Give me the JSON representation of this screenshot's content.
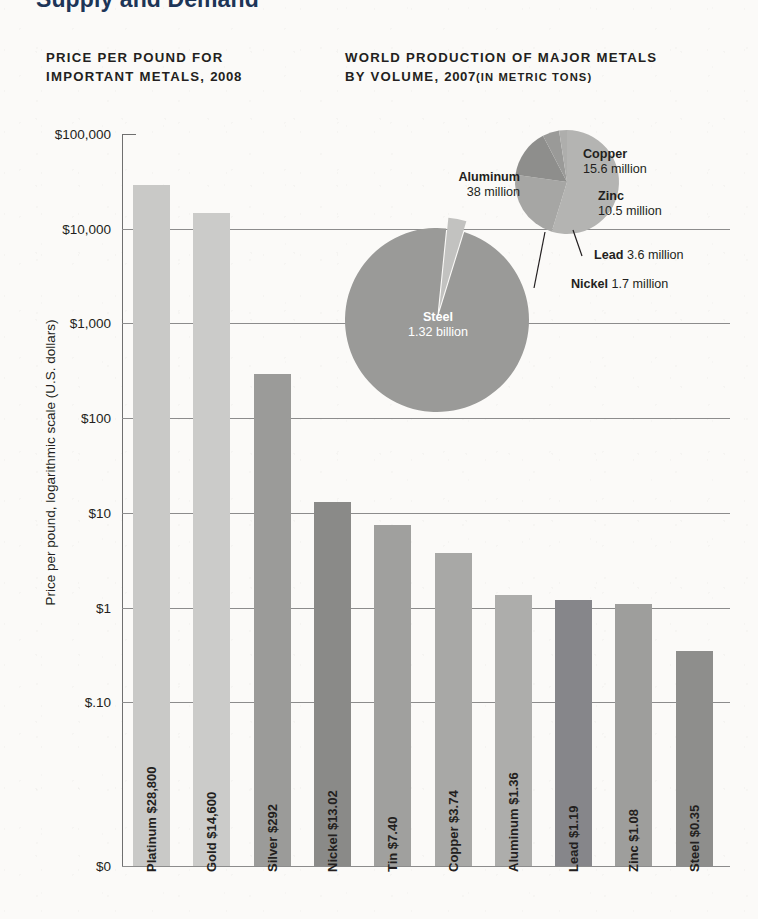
{
  "page": {
    "title": "Supply and Demand",
    "background_color": "#fbfaf8"
  },
  "headings": {
    "left_line1": "PRICE PER POUND FOR",
    "left_line2": "IMPORTANT METALS, ",
    "left_year": "2008",
    "right_line1": "WORLD PRODUCTION OF MAJOR METALS",
    "right_line2": "BY VOLUME, ",
    "right_year": "2007",
    "right_units": "(IN METRIC TONS)"
  },
  "chart_data": [
    {
      "type": "bar",
      "title": "PRICE PER POUND FOR IMPORTANT METALS, 2008",
      "xlabel": "",
      "ylabel": "Price per pound, logarithmic scale (U.S. dollars)",
      "scale": "log",
      "grid": true,
      "legend": "none",
      "ylim": [
        0.1,
        100000
      ],
      "ytick_labels": [
        "$100,000",
        "$10,000",
        "$1,000",
        "$100",
        "$10",
        "$1",
        "$.10",
        "$0"
      ],
      "ytick_values": [
        100000,
        10000,
        1000,
        100,
        10,
        1,
        0.1,
        0
      ],
      "categories": [
        "Platinum",
        "Gold",
        "Silver",
        "Nickel",
        "Tin",
        "Copper",
        "Aluminum",
        "Lead",
        "Zinc",
        "Steel"
      ],
      "values": [
        28800,
        14600,
        292,
        13.02,
        7.4,
        3.74,
        1.36,
        1.19,
        1.08,
        0.35
      ],
      "bars": [
        {
          "name": "Platinum",
          "label": "Platinum $28,800",
          "value": 28800,
          "value_text": "$28,800",
          "color": "#c9c9c7"
        },
        {
          "name": "Gold",
          "label": "Gold $14,600",
          "value": 14600,
          "value_text": "$14,600",
          "color": "#cbcbc9"
        },
        {
          "name": "Silver",
          "label": "Silver $292",
          "value": 292,
          "value_text": "$292",
          "color": "#9b9b99"
        },
        {
          "name": "Nickel",
          "label": "Nickel $13.02",
          "value": 13.02,
          "value_text": "$13.02",
          "color": "#8a8a88"
        },
        {
          "name": "Tin",
          "label": "Tin $7.40",
          "value": 7.4,
          "value_text": "$7.40",
          "color": "#a0a09e"
        },
        {
          "name": "Copper",
          "label": "Copper $3.74",
          "value": 3.74,
          "value_text": "$3.74",
          "color": "#a8a8a6"
        },
        {
          "name": "Aluminum",
          "label": "Aluminum $1.36",
          "value": 1.36,
          "value_text": "$1.36",
          "color": "#adadab"
        },
        {
          "name": "Lead",
          "label": "Lead $1.19",
          "value": 1.19,
          "value_text": "$1.19",
          "color": "#86868a"
        },
        {
          "name": "Zinc",
          "label": "Zinc $1.08",
          "value": 1.08,
          "value_text": "$1.08",
          "color": "#9e9e9c"
        },
        {
          "name": "Steel",
          "label": "Steel $0.35",
          "value": 0.35,
          "value_text": "$0.35",
          "color": "#8e8e8c"
        }
      ]
    },
    {
      "type": "pie",
      "title": "WORLD PRODUCTION OF MAJOR METALS BY VOLUME, 2007 (IN METRIC TONS)",
      "legend": "labels-on-chart",
      "groups": [
        {
          "name": "steel-pie",
          "slices": [
            {
              "name": "Steel",
              "label": "Steel",
              "value_text": "1.32 billion",
              "value": 1320000000,
              "color": "#9a9a98"
            }
          ]
        },
        {
          "name": "other-metals-pie",
          "slices": [
            {
              "name": "Aluminum",
              "label": "Aluminum",
              "value_text": "38 million",
              "value": 38000000,
              "color": "#b4b4b2"
            },
            {
              "name": "Copper",
              "label": "Copper",
              "value_text": "15.6 million",
              "value": 15600000,
              "color": "#a6a6a4"
            },
            {
              "name": "Zinc",
              "label": "Zinc",
              "value_text": "10.5 million",
              "value": 10500000,
              "color": "#8e8e8c"
            },
            {
              "name": "Lead",
              "label": "Lead",
              "value_text": "3.6 million",
              "value": 3600000,
              "color": "#9a9a98"
            },
            {
              "name": "Nickel",
              "label": "Nickel",
              "value_text": "1.7 million",
              "value": 1700000,
              "color": "#aeaeac"
            }
          ]
        }
      ]
    }
  ]
}
